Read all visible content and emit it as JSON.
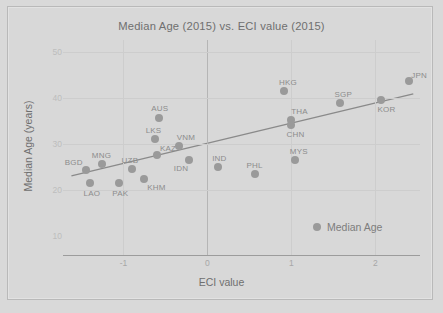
{
  "chart_data": {
    "type": "scatter",
    "title": "Median Age (2015) vs. ECI value (2015)",
    "xlabel": "ECI value",
    "ylabel": "Median Age (years)",
    "xlim": [
      -1.72,
      2.53
    ],
    "ylim": [
      5.8,
      52.5
    ],
    "xticks": [
      "-1",
      "0",
      "1",
      "2"
    ],
    "xtick_values": [
      -1,
      0,
      1,
      2
    ],
    "yticks": [
      "50",
      "40",
      "30",
      "20",
      "10"
    ],
    "ytick_values": [
      50,
      40,
      30,
      20,
      10
    ],
    "grid": true,
    "legend_position": "bottom-right",
    "series": [
      {
        "name": "Median Age",
        "marker_color": "#9a9a9a",
        "points": [
          {
            "label": "BGD",
            "x": -1.45,
            "y": 24.3,
            "label_dx": -12,
            "label_dy": -8
          },
          {
            "label": "LAO",
            "x": -1.4,
            "y": 21.5,
            "label_dx": 2,
            "label_dy": 10
          },
          {
            "label": "MNG",
            "x": -1.25,
            "y": 25.6,
            "label_dx": -1,
            "label_dy": -9
          },
          {
            "label": "PAK",
            "x": -1.05,
            "y": 21.4,
            "label_dx": 1,
            "label_dy": 10
          },
          {
            "label": "UZB",
            "x": -0.9,
            "y": 24.5,
            "label_dx": -2,
            "label_dy": -9
          },
          {
            "label": "KHM",
            "x": -0.75,
            "y": 22.4,
            "label_dx": 12,
            "label_dy": 8
          },
          {
            "label": "LKS",
            "x": -0.63,
            "y": 30.9,
            "label_dx": -1,
            "label_dy": -9
          },
          {
            "label": "KAZ",
            "x": -0.6,
            "y": 27.5,
            "label_dx": 11,
            "label_dy": -7
          },
          {
            "label": "AUS",
            "x": -0.58,
            "y": 35.6,
            "label_dx": 1,
            "label_dy": -10
          },
          {
            "label": "VNM",
            "x": -0.34,
            "y": 29.4,
            "label_dx": 7,
            "label_dy": -9
          },
          {
            "label": "IDN",
            "x": -0.22,
            "y": 26.5,
            "label_dx": -8,
            "label_dy": 8
          },
          {
            "label": "IND",
            "x": 0.13,
            "y": 25.0,
            "label_dx": 1,
            "label_dy": -9
          },
          {
            "label": "PHL",
            "x": 0.56,
            "y": 23.4,
            "label_dx": 0,
            "label_dy": -9
          },
          {
            "label": "HKG",
            "x": 0.91,
            "y": 41.4,
            "label_dx": 4,
            "label_dy": -9
          },
          {
            "label": "THA",
            "x": 1.0,
            "y": 35.2,
            "label_dx": 8,
            "label_dy": -9
          },
          {
            "label": "CHN",
            "x": 1.0,
            "y": 34.1,
            "label_dx": 4,
            "label_dy": 9
          },
          {
            "label": "MYS",
            "x": 1.04,
            "y": 26.5,
            "label_dx": 4,
            "label_dy": -9
          },
          {
            "label": "SGP",
            "x": 1.58,
            "y": 38.8,
            "label_dx": 3,
            "label_dy": -9
          },
          {
            "label": "KOR",
            "x": 2.06,
            "y": 39.4,
            "label_dx": 6,
            "label_dy": 9
          },
          {
            "label": "JPN",
            "x": 2.4,
            "y": 43.5,
            "label_dx": 10,
            "label_dy": -6
          }
        ]
      }
    ],
    "trendline": {
      "x1": -1.62,
      "y1": 23.0,
      "x2": 2.45,
      "y2": 40.8,
      "color": "#8a8a8a"
    },
    "legend": [
      {
        "label": "Median Age",
        "marker": "circle",
        "color": "#9a9a9a"
      }
    ]
  },
  "colors": {
    "background": "#d9d9d9",
    "frame_border": "#b9b9b9",
    "gridline": "#cdcdcd",
    "zero_line": "#b5b5b5",
    "axis_line": "#9c9c9c",
    "title_text": "#6f6f6f",
    "tick_text": "#b0b0b0",
    "point_label_text": "#8c8c8c"
  }
}
